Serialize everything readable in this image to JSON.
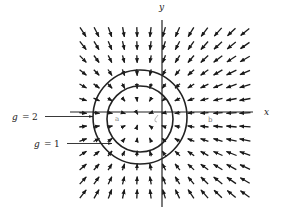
{
  "figure": {
    "axes": {
      "x_label": "x",
      "y_label": "y"
    },
    "level_curves": [
      {
        "label_var": "g",
        "label_eq": "=",
        "label_val": "2",
        "full_label": "g = 2",
        "cx": 140,
        "cy": 117,
        "r": 47
      },
      {
        "label_var": "g",
        "label_eq": "=",
        "label_val": "1",
        "full_label": "g = 1",
        "cx": 140,
        "cy": 119,
        "r": 33
      }
    ],
    "point_labels": [
      "a",
      "b"
    ],
    "field": {
      "description": "Gradient vector field converging toward a sink on the negative x-axis, shown with level curves g=1 and g=2",
      "grid_cols": 13,
      "grid_rows": 13,
      "x_start": 83,
      "y_start": 32,
      "spacing": 13.5,
      "sink_x": 140,
      "sink_y": 118,
      "color": "#1a1a1a"
    }
  },
  "chart_data": {
    "type": "vector-field",
    "title": "",
    "xlabel": "x",
    "ylabel": "y",
    "grid": "13x13 arrows",
    "annotations": [
      "g = 2",
      "g = 1",
      "a",
      "b"
    ],
    "level_curves": [
      {
        "name": "g = 2",
        "shape": "circle",
        "outer": true
      },
      {
        "name": "g = 1",
        "shape": "circle",
        "outer": false
      }
    ],
    "field_behavior": "arrows point inward toward a point on the negative x-axis inside the circles; arrow length grows with distance"
  }
}
